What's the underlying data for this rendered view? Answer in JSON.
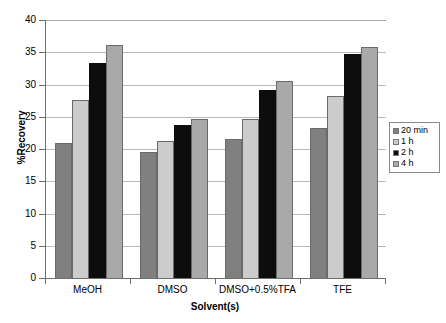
{
  "chart_data": {
    "type": "bar",
    "title": "",
    "xlabel": "Solvent(s)",
    "ylabel": "%Recovery",
    "categories": [
      "MeOH",
      "DMSO",
      "DMSO+0.5%TFA",
      "TFE"
    ],
    "series": [
      {
        "name": "20 min",
        "color": "#808080",
        "values": [
          21.0,
          19.6,
          21.5,
          23.2
        ]
      },
      {
        "name": "1 h",
        "color": "#cccccc",
        "values": [
          27.6,
          21.3,
          24.6,
          28.2
        ]
      },
      {
        "name": "2 h",
        "color": "#0d0d0d",
        "values": [
          33.3,
          23.8,
          29.1,
          34.7
        ]
      },
      {
        "name": "4 h",
        "color": "#a9a9a9",
        "values": [
          36.1,
          24.7,
          30.5,
          35.8
        ]
      }
    ],
    "ylim": [
      0,
      40
    ],
    "yticks": [
      0,
      5,
      10,
      15,
      20,
      25,
      30,
      35,
      40
    ],
    "ytick_labels": [
      "0",
      "5",
      "10",
      "15",
      "20",
      "25",
      "30",
      "35",
      "40"
    ],
    "grid": true,
    "legend_position": "right"
  },
  "legend": {
    "items": [
      {
        "label": "20 min"
      },
      {
        "label": "1 h"
      },
      {
        "label": "2 h"
      },
      {
        "label": "4 h"
      }
    ]
  }
}
